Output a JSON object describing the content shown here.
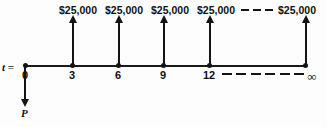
{
  "diagram": {
    "type": "cash-flow-diagram",
    "title": "",
    "axis_label": "t =",
    "present_worth_label": "P",
    "infinity_symbol": "∞",
    "tick_labels": [
      "0",
      "3",
      "6",
      "9",
      "12"
    ],
    "cash_flow_label": "$25,000",
    "cash_flows": [
      {
        "time": "3",
        "amount": "$25,000",
        "direction": "up"
      },
      {
        "time": "6",
        "amount": "$25,000",
        "direction": "up"
      },
      {
        "time": "9",
        "amount": "$25,000",
        "direction": "up"
      },
      {
        "time": "12",
        "amount": "$25,000",
        "direction": "up"
      },
      {
        "time": "∞",
        "amount": "$25,000",
        "direction": "up"
      }
    ],
    "present_worth": {
      "time": "0",
      "direction": "down"
    },
    "colors": {
      "ink": "#141414",
      "background": "#fdfdfd"
    }
  }
}
